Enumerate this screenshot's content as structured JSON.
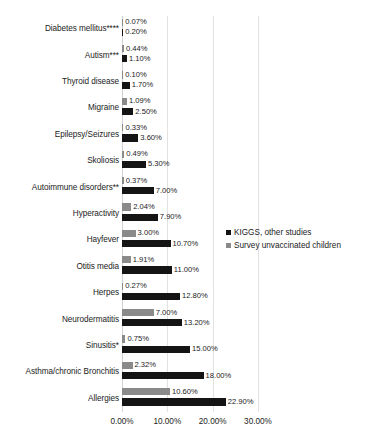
{
  "chart_data": {
    "type": "bar",
    "orientation": "horizontal",
    "title": "",
    "xlabel": "",
    "ylabel": "",
    "xlim": [
      0,
      30
    ],
    "grid": true,
    "legend_position": "right",
    "tick_labels": [
      "0.00%",
      "10.00%",
      "20.00%",
      "30.00%"
    ],
    "tick_values": [
      0,
      10,
      20,
      30
    ],
    "categories": [
      "Diabetes mellitus****",
      "Autism***",
      "Thyroid disease",
      "Migraine",
      "Epilepsy/Seizures",
      "Skoliosis",
      "Autoimmune disorders**",
      "Hyperactivity",
      "Hayfever",
      "Otitis media",
      "Herpes",
      "Neurodermatitis",
      "Sinusitis*",
      "Asthma/chronic Bronchitis",
      "Allergies"
    ],
    "series": [
      {
        "name": "KIGGS, other studies",
        "color": "#141414",
        "values": [
          0.2,
          1.1,
          1.7,
          2.5,
          3.6,
          5.3,
          7.0,
          7.9,
          10.7,
          11.0,
          12.8,
          13.2,
          15.0,
          18.0,
          22.9
        ],
        "labels": [
          "0.20%",
          "1.10%",
          "1.70%",
          "2.50%",
          "3.60%",
          "5.30%",
          "7.00%",
          "7.90%",
          "10.70%",
          "11.00%",
          "12.80%",
          "13.20%",
          "15.00%",
          "18.00%",
          "22.90%"
        ]
      },
      {
        "name": "Survey unvaccinated children",
        "color": "#8a8a8a",
        "values": [
          0.07,
          0.44,
          0.1,
          1.09,
          0.33,
          0.49,
          0.37,
          2.04,
          3.0,
          1.91,
          0.27,
          7.0,
          0.75,
          2.32,
          10.6
        ],
        "labels": [
          "0.07%",
          "0.44%",
          "0.10%",
          "1.09%",
          "0.33%",
          "0.49%",
          "0.37%",
          "2.04%",
          "3.00%",
          "1.91%",
          "0.27%",
          "7.00%",
          "0.75%",
          "2.32%",
          "10.60%"
        ]
      }
    ]
  },
  "legend": {
    "items": [
      {
        "label": "KIGGS, other studies",
        "color": "#141414"
      },
      {
        "label": "Survey unvaccinated children",
        "color": "#8a8a8a"
      }
    ]
  }
}
